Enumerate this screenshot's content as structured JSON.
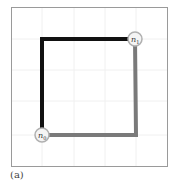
{
  "figure": {
    "caption": "(a)",
    "frame": {
      "x": 11,
      "y": 7,
      "w": 156,
      "h": 159,
      "color": "#9a9a9a"
    },
    "grid": {
      "color": "#f0f0f0",
      "xs": [
        42,
        74,
        105,
        136
      ],
      "ys": [
        39,
        70,
        101,
        135
      ]
    },
    "nodes": [
      {
        "id": "n0",
        "label": "n",
        "sub": "0",
        "x": 42,
        "y": 135
      },
      {
        "id": "n1",
        "label": "n",
        "sub": "1",
        "x": 135,
        "y": 39
      }
    ],
    "paths": [
      {
        "name": "black-path",
        "color": "#111111",
        "points": [
          [
            42,
            135
          ],
          [
            42,
            39
          ],
          [
            135,
            39
          ]
        ]
      },
      {
        "name": "gray-path",
        "color": "#7a7a7a",
        "points": [
          [
            135,
            39
          ],
          [
            136,
            135
          ],
          [
            42,
            135
          ]
        ]
      }
    ],
    "node_style": {
      "radius": 7,
      "stroke": "#b0b0b0",
      "fill": "#f4f4f4",
      "text_color": "#333333"
    }
  }
}
